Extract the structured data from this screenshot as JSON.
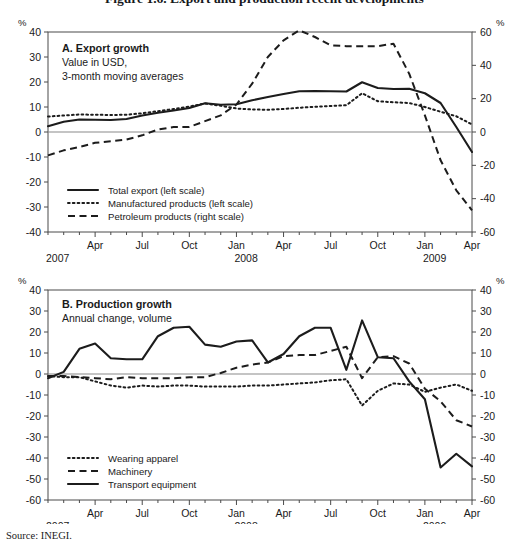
{
  "figure": {
    "title": "Figure 1.6.  Export and production recent developments",
    "source": "Source:  INEGI.",
    "unit_symbol": "%"
  },
  "panel_a": {
    "title": "A. Export growth",
    "subtitle_line1": "Value in USD,",
    "subtitle_line2": "3-month moving averages",
    "legend": [
      {
        "label": "Total export (left scale)",
        "style": "solid"
      },
      {
        "label": "Manufactured products (left scale)",
        "style": "dotted"
      },
      {
        "label": "Petroleum products (right scale)",
        "style": "dashed"
      }
    ]
  },
  "panel_b": {
    "title": "B. Production growth",
    "subtitle_line1": "Annual change, volume",
    "legend": [
      {
        "label": "Wearing apparel",
        "style": "dotted"
      },
      {
        "label": "Machinery",
        "style": "dashed"
      },
      {
        "label": "Transport equipment",
        "style": "solid"
      }
    ]
  },
  "x_axis": {
    "tick_labels": [
      "Apr",
      "Jul",
      "Oct",
      "Jan",
      "Apr",
      "Jul",
      "Oct",
      "Jan",
      "Apr"
    ],
    "tick_positions": [
      3,
      6,
      9,
      12,
      15,
      18,
      21,
      24,
      27
    ],
    "year_labels": [
      {
        "text": "2007",
        "position": 0
      },
      {
        "text": "2008",
        "position": 12
      },
      {
        "text": "2009",
        "position": 24
      }
    ],
    "range": [
      0,
      28
    ]
  },
  "chart_data": [
    {
      "type": "line",
      "title": "A. Export growth",
      "subtitle": "Value in USD, 3-month moving averages",
      "xlabel": "",
      "ylabel": "%",
      "ylim": [
        -40,
        40
      ],
      "yticks": [
        40,
        30,
        20,
        10,
        0,
        -10,
        -20,
        -30,
        -40
      ],
      "ylim_right": [
        -60,
        60
      ],
      "yticks_right": [
        60,
        40,
        20,
        0,
        -20,
        -40,
        -60
      ],
      "grid": false,
      "legend_position": "lower-left",
      "x": [
        "2007-01",
        "2007-02",
        "2007-03",
        "2007-04",
        "2007-05",
        "2007-06",
        "2007-07",
        "2007-08",
        "2007-09",
        "2007-10",
        "2007-11",
        "2007-12",
        "2008-01",
        "2008-02",
        "2008-03",
        "2008-04",
        "2008-05",
        "2008-06",
        "2008-07",
        "2008-08",
        "2008-09",
        "2008-10",
        "2008-11",
        "2008-12",
        "2009-01",
        "2009-02",
        "2009-03",
        "2009-04"
      ],
      "series": [
        {
          "name": "Total export (left scale)",
          "style": "solid",
          "axis": "left",
          "values": [
            2.3,
            4.1,
            5.0,
            4.9,
            4.8,
            5.2,
            6.6,
            7.7,
            8.6,
            9.6,
            11.5,
            10.9,
            11.1,
            12.7,
            14.0,
            15.2,
            16.3,
            16.4,
            16.3,
            16.2,
            19.9,
            17.6,
            17.2,
            17.3,
            15.5,
            11.6,
            2.0,
            -8.0
          ]
        },
        {
          "name": "Manufactured products (left scale)",
          "style": "dotted",
          "axis": "left",
          "values": [
            6.2,
            6.6,
            7.0,
            6.9,
            6.8,
            6.9,
            7.5,
            8.3,
            9.2,
            10.2,
            11.4,
            10.5,
            9.4,
            9.0,
            8.9,
            9.2,
            9.7,
            10.1,
            10.4,
            10.7,
            15.5,
            12.3,
            11.9,
            11.6,
            10.0,
            8.1,
            6.3,
            3.0
          ]
        },
        {
          "name": "Petroleum products (right scale)",
          "style": "dashed",
          "axis": "right",
          "values": [
            -14.0,
            -11.0,
            -9.0,
            -6.5,
            -5.5,
            -4.5,
            -2.0,
            1.5,
            3.0,
            3.0,
            6.5,
            10.0,
            16.5,
            29.0,
            45.0,
            55.0,
            61.0,
            57.0,
            52.0,
            51.5,
            51.5,
            51.5,
            53.0,
            35.0,
            10.0,
            -17.0,
            -35.0,
            -47.0
          ]
        }
      ]
    },
    {
      "type": "line",
      "title": "B. Production growth",
      "subtitle": "Annual change, volume",
      "xlabel": "",
      "ylabel": "%",
      "ylim": [
        -60,
        40
      ],
      "yticks": [
        40,
        30,
        20,
        10,
        0,
        -10,
        -20,
        -30,
        -40,
        -50,
        -60
      ],
      "ylim_right": [
        -60,
        40
      ],
      "yticks_right": [
        40,
        30,
        20,
        10,
        0,
        -10,
        -20,
        -30,
        -40,
        -50,
        -60
      ],
      "grid": false,
      "legend_position": "lower-left",
      "x": [
        "2007-01",
        "2007-02",
        "2007-03",
        "2007-04",
        "2007-05",
        "2007-06",
        "2007-07",
        "2007-08",
        "2007-09",
        "2007-10",
        "2007-11",
        "2007-12",
        "2008-01",
        "2008-02",
        "2008-03",
        "2008-04",
        "2008-05",
        "2008-06",
        "2008-07",
        "2008-08",
        "2008-09",
        "2008-10",
        "2008-11",
        "2008-12",
        "2009-01",
        "2009-02",
        "2009-03",
        "2009-04"
      ],
      "series": [
        {
          "name": "Wearing apparel",
          "style": "dotted",
          "axis": "left",
          "values": [
            -1.0,
            -1.5,
            -1.5,
            -3.5,
            -5.5,
            -6.5,
            -5.5,
            -6.0,
            -5.5,
            -5.5,
            -6.0,
            -6.0,
            -6.0,
            -5.5,
            -5.5,
            -5.0,
            -4.5,
            -4.0,
            -3.0,
            -2.5,
            -15.0,
            -8.0,
            -4.5,
            -5.0,
            -8.5,
            -6.5,
            -5.0,
            -8.0
          ]
        },
        {
          "name": "Machinery",
          "style": "dashed",
          "axis": "left",
          "values": [
            -1.0,
            -1.0,
            -1.5,
            -2.0,
            -2.5,
            -1.5,
            -2.0,
            -2.0,
            -2.0,
            -1.5,
            -1.5,
            0.5,
            3.0,
            4.5,
            5.5,
            8.5,
            9.0,
            9.0,
            11.0,
            13.0,
            -2.0,
            8.0,
            8.5,
            5.0,
            -7.0,
            -13.0,
            -22.0,
            -25.0
          ]
        },
        {
          "name": "Transport equipment",
          "style": "solid",
          "axis": "left",
          "values": [
            -2.0,
            1.0,
            12.0,
            14.5,
            7.5,
            7.0,
            7.0,
            18.0,
            22.0,
            22.5,
            14.0,
            13.0,
            15.5,
            16.0,
            5.5,
            9.5,
            18.0,
            22.0,
            22.0,
            2.0,
            25.5,
            8.0,
            7.5,
            -3.5,
            -12.0,
            -44.5,
            -38.0,
            -44.0
          ]
        }
      ]
    }
  ]
}
